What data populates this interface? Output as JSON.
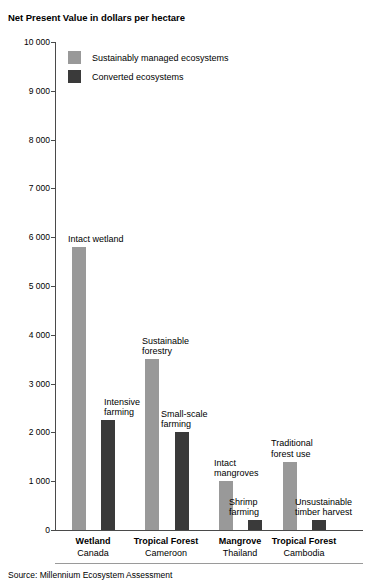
{
  "chart_data": {
    "type": "bar",
    "title": "Net Present Value in dollars per hectare",
    "xlabel": "",
    "ylabel": "",
    "ylim": [
      0,
      10000
    ],
    "ytick_labels": [
      "10 000",
      "9 000",
      "8 000",
      "7 000",
      "6 000",
      "5 000",
      "4 000",
      "3 000",
      "2 000",
      "1 000",
      "0"
    ],
    "ytick_values": [
      10000,
      9000,
      8000,
      7000,
      6000,
      5000,
      4000,
      3000,
      2000,
      1000,
      0
    ],
    "grid": false,
    "legend_position": "top-left",
    "categories": [
      "Wetland",
      "Tropical Forest",
      "Mangrove",
      "Tropical Forest"
    ],
    "category_places": [
      "Canada",
      "Cameroon",
      "Thailand",
      "Cambodia"
    ],
    "series": [
      {
        "name": "Sustainably managed ecosystems",
        "color": "#999999",
        "values": [
          5800,
          3500,
          1000,
          1400
        ],
        "point_labels": [
          "Intact wetland",
          "Sustainable\nforestry",
          "Intact\nmangroves",
          "Traditional\nforest use"
        ]
      },
      {
        "name": "Converted ecosystems",
        "color": "#3a3a3a",
        "values": [
          2250,
          2000,
          200,
          200
        ],
        "point_labels": [
          "Intensive\nfarming",
          "Small-scale\nfarming",
          "Shrimp\nfarming",
          "Unsustainable\ntimber harvest"
        ]
      }
    ],
    "source": "Source: Millennium Ecosystem Assessment"
  },
  "legend": {
    "items": [
      {
        "label": "Sustainably managed ecosystems",
        "color": "#999999"
      },
      {
        "label": "Converted ecosystems",
        "color": "#3a3a3a"
      }
    ]
  }
}
